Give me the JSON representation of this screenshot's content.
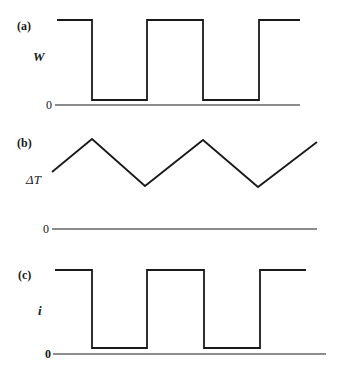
{
  "chart_data": [
    {
      "type": "line",
      "panel": "(a)",
      "ylabel": "W",
      "zero_label": "0",
      "waveform": "square",
      "levels": {
        "high": 1,
        "low": 0.07
      },
      "x": [
        0,
        0.14,
        0.14,
        0.37,
        0.37,
        0.6,
        0.6,
        0.83,
        0.83,
        1.0
      ],
      "y": [
        1,
        1,
        0.07,
        0.07,
        1,
        1,
        0.07,
        0.07,
        1,
        1
      ],
      "pixel_points": [
        [
          57,
          20
        ],
        [
          92,
          20
        ],
        [
          92,
          100
        ],
        [
          147,
          100
        ],
        [
          147,
          20
        ],
        [
          203,
          20
        ],
        [
          203,
          100
        ],
        [
          259,
          100
        ],
        [
          259,
          20
        ],
        [
          300,
          20
        ]
      ],
      "baseline": {
        "y": 105,
        "x1": 55,
        "x2": 300
      }
    },
    {
      "type": "line",
      "panel": "(b)",
      "ylabel": "ΔT",
      "zero_label": "0",
      "waveform": "triangle",
      "x": [
        0,
        0.15,
        0.35,
        0.57,
        0.78,
        1.0
      ],
      "y": [
        0.64,
        0.98,
        0.48,
        0.98,
        0.47,
        0.91
      ],
      "pixel_points": [
        [
          52,
          172
        ],
        [
          92,
          139
        ],
        [
          145,
          186
        ],
        [
          203,
          140
        ],
        [
          258,
          187
        ],
        [
          317,
          142
        ]
      ],
      "baseline": {
        "y": 229,
        "x1": 52,
        "x2": 317
      }
    },
    {
      "type": "line",
      "panel": "(c)",
      "ylabel": "i",
      "zero_label": "0",
      "waveform": "square",
      "levels": {
        "high": 1,
        "low": 0.07
      },
      "x": [
        0,
        0.14,
        0.14,
        0.36,
        0.36,
        0.59,
        0.59,
        0.81,
        0.81,
        1.0
      ],
      "y": [
        1,
        1,
        0.07,
        0.07,
        1,
        1,
        0.07,
        0.07,
        1,
        1
      ],
      "pixel_points": [
        [
          55,
          270
        ],
        [
          92,
          270
        ],
        [
          92,
          348
        ],
        [
          147,
          348
        ],
        [
          147,
          270
        ],
        [
          204,
          270
        ],
        [
          204,
          348
        ],
        [
          260,
          348
        ],
        [
          260,
          270
        ],
        [
          306,
          270
        ]
      ],
      "baseline": {
        "y": 354,
        "x1": 53,
        "x2": 326
      }
    }
  ],
  "labels": {
    "a": {
      "panel": "(a)",
      "axis": "W",
      "zero": "0"
    },
    "b": {
      "panel": "(b)",
      "axis": "ΔT",
      "zero": "0"
    },
    "c": {
      "panel": "(c)",
      "axis": "i",
      "zero": "0"
    }
  },
  "colors": {
    "ink": "#1a1a1a",
    "background": "#ffffff"
  }
}
